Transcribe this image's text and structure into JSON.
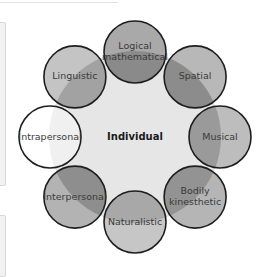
{
  "diagram": {
    "center": {
      "label": "Individual",
      "color": "#e6e6e6"
    },
    "nodes": [
      {
        "id": "logical-mathematical",
        "lines": [
          "Logical",
          "mathematical"
        ],
        "color": "#a9a9a9",
        "overlap_color": "#8a8a8a"
      },
      {
        "id": "spatial",
        "lines": [
          "Spatial"
        ],
        "color": "#b8b8b8",
        "overlap_color": "#8c8c8c"
      },
      {
        "id": "musical",
        "lines": [
          "Musical"
        ],
        "color": "#bdbdbd",
        "overlap_color": "#9a9a9a"
      },
      {
        "id": "bodily-kinesthetic",
        "lines": [
          "Bodily",
          "kinesthetic"
        ],
        "color": "#b5b5b5",
        "overlap_color": "#939393"
      },
      {
        "id": "naturalistic",
        "lines": [
          "Naturalistic"
        ],
        "color": "#c6c6c6",
        "overlap_color": "#a8a8a8"
      },
      {
        "id": "interpersonal",
        "lines": [
          "Interpersonal"
        ],
        "color": "#b3b3b3",
        "overlap_color": "#8e8e8e"
      },
      {
        "id": "intrapersonal",
        "lines": [
          "Intrapersonal"
        ],
        "color": "#ffffff",
        "overlap_color": "#f0f0f0"
      },
      {
        "id": "linguistic",
        "lines": [
          "Linguistic"
        ],
        "color": "#c4c4c4",
        "overlap_color": "#a2a2a2"
      }
    ],
    "stroke_color": "#1e1e1e"
  }
}
